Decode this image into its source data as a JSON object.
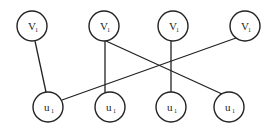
{
  "diagram": {
    "type": "bipartite-graph",
    "colors": {
      "stroke": "#222222",
      "background": "#ffffff",
      "node_fill": "#ffffff"
    },
    "node_radius": 15,
    "top_nodes": [
      {
        "id": "v1",
        "label": "V",
        "subscript": "1",
        "cx": 32,
        "cy": 26
      },
      {
        "id": "v2",
        "label": "V",
        "subscript": "1",
        "cx": 104,
        "cy": 26
      },
      {
        "id": "v3",
        "label": "V",
        "subscript": "1",
        "cx": 173,
        "cy": 26
      },
      {
        "id": "v4",
        "label": "V",
        "subscript": "1",
        "cx": 245,
        "cy": 26
      }
    ],
    "bottom_nodes": [
      {
        "id": "u1",
        "label": "u",
        "subscript": "1",
        "cx": 48,
        "cy": 107
      },
      {
        "id": "u2",
        "label": "u",
        "subscript": "1",
        "cx": 110,
        "cy": 107
      },
      {
        "id": "u3",
        "label": "u",
        "subscript": "1",
        "cx": 171,
        "cy": 107
      },
      {
        "id": "u4",
        "label": "u",
        "subscript": "1",
        "cx": 229,
        "cy": 107
      }
    ],
    "edges": [
      {
        "from": "v1",
        "to": "u1",
        "x1": 35,
        "y1": 41,
        "x2": 46,
        "y2": 92
      },
      {
        "from": "v2",
        "to": "u2",
        "x1": 105,
        "y1": 41,
        "x2": 105,
        "y2": 93
      },
      {
        "from": "v2",
        "to": "u4",
        "x1": 106,
        "y1": 41,
        "x2": 222,
        "y2": 94
      },
      {
        "from": "v3",
        "to": "u3",
        "x1": 171,
        "y1": 41,
        "x2": 171,
        "y2": 92
      },
      {
        "from": "v4",
        "to": "u1",
        "x1": 236,
        "y1": 38,
        "x2": 62,
        "y2": 100
      }
    ]
  }
}
